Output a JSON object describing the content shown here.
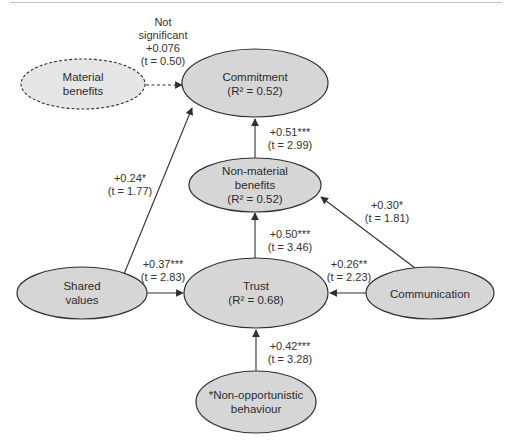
{
  "colors": {
    "node_fill": "#d6d6d6",
    "node_fill_light": "#e6e6e6",
    "stroke": "#2f2f2f",
    "rule": "#bdbdbd"
  },
  "nodes": {
    "commitment": {
      "line1": "Commitment",
      "line2": "(R² = 0.52)"
    },
    "material_benefits": {
      "line1": "Material",
      "line2": "benefits",
      "style": "dashed"
    },
    "non_material_benefits": {
      "line1": "Non-material",
      "line2": "benefits",
      "line3": "(R² = 0.52)"
    },
    "trust": {
      "line1": "Trust",
      "line2": "(R² = 0.68)"
    },
    "shared_values": {
      "line1": "Shared",
      "line2": "values"
    },
    "communication": {
      "line1": "Communication"
    },
    "non_opportunistic_behaviour": {
      "line1": "*Non-opportunistic",
      "line2": "behaviour"
    }
  },
  "edges": {
    "material_to_commitment": {
      "line1": "Not",
      "line2": "significant",
      "coef": "+0.076",
      "t": "(t = 0.50)",
      "style": "dashed"
    },
    "shared_to_commitment": {
      "coef": "+0.24*",
      "t": "(t = 1.77)"
    },
    "nonmaterial_to_commitment": {
      "coef": "+0.51***",
      "t": "(t = 2.99)"
    },
    "communication_to_nonmaterial": {
      "coef": "+0.30*",
      "t": "(t = 1.81)"
    },
    "trust_to_nonmaterial": {
      "coef": "+0.50***",
      "t": "(t = 3.46)"
    },
    "shared_to_trust": {
      "coef": "+0.37***",
      "t": "(t = 2.83)"
    },
    "communication_to_trust": {
      "coef": "+0.26**",
      "t": "(t = 2.23)"
    },
    "nonopportunistic_to_trust": {
      "coef": "+0.42***",
      "t": "(t = 3.28)"
    }
  }
}
